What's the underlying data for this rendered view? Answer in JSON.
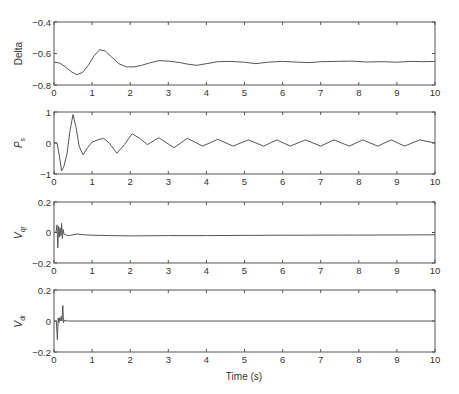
{
  "figure": {
    "xlabel": "Time (s)",
    "colors": {
      "axis": "#555555",
      "line": "#555555",
      "text": "#333333"
    }
  },
  "chart_data": [
    {
      "type": "line",
      "ylabel": "Delta",
      "ylabel_sub": "",
      "ylabel_italic": false,
      "ylim": [
        -0.8,
        -0.4
      ],
      "yticks": [
        -0.8,
        -0.6,
        -0.4
      ],
      "ytick_labels": [
        "−0.8",
        "−0.6",
        "−0.4"
      ],
      "xlim": [
        0,
        10
      ],
      "xticks": [
        0,
        1,
        2,
        3,
        4,
        5,
        6,
        7,
        8,
        9,
        10
      ],
      "grid": false,
      "x": [
        0,
        0.15,
        0.3,
        0.45,
        0.6,
        0.75,
        0.9,
        1.05,
        1.2,
        1.35,
        1.5,
        1.7,
        1.9,
        2.1,
        2.3,
        2.5,
        2.75,
        3.0,
        3.3,
        3.5,
        3.75,
        4.0,
        4.3,
        4.6,
        5.0,
        5.3,
        5.6,
        6.0,
        6.4,
        6.7,
        7.0,
        7.4,
        7.8,
        8.2,
        8.6,
        9.0,
        9.4,
        9.7,
        10
      ],
      "values": [
        -0.655,
        -0.66,
        -0.685,
        -0.715,
        -0.735,
        -0.72,
        -0.675,
        -0.615,
        -0.575,
        -0.585,
        -0.62,
        -0.665,
        -0.685,
        -0.685,
        -0.675,
        -0.66,
        -0.645,
        -0.648,
        -0.657,
        -0.667,
        -0.675,
        -0.665,
        -0.652,
        -0.65,
        -0.655,
        -0.665,
        -0.655,
        -0.65,
        -0.655,
        -0.658,
        -0.652,
        -0.65,
        -0.648,
        -0.654,
        -0.652,
        -0.655,
        -0.65,
        -0.652,
        -0.65
      ]
    },
    {
      "type": "line",
      "ylabel": "P",
      "ylabel_sub": "s",
      "ylabel_italic": true,
      "ylim": [
        -1,
        1
      ],
      "yticks": [
        -1,
        0,
        1
      ],
      "ytick_labels": [
        "−1",
        "0",
        "1"
      ],
      "xlim": [
        0,
        10
      ],
      "xticks": [
        0,
        1,
        2,
        3,
        4,
        5,
        6,
        7,
        8,
        9,
        10
      ],
      "grid": false,
      "x": [
        0,
        0.08,
        0.14,
        0.2,
        0.26,
        0.34,
        0.42,
        0.5,
        0.58,
        0.66,
        0.76,
        0.88,
        1.0,
        1.15,
        1.3,
        1.45,
        1.65,
        1.85,
        2.05,
        2.25,
        2.45,
        2.75,
        3.15,
        3.5,
        3.9,
        4.3,
        4.7,
        5.1,
        5.5,
        5.85,
        6.2,
        6.6,
        7.0,
        7.35,
        7.75,
        8.1,
        8.5,
        8.85,
        9.2,
        9.6,
        10
      ],
      "values": [
        0,
        0,
        -0.4,
        -0.9,
        -0.75,
        -0.35,
        0.4,
        0.92,
        0.5,
        -0.1,
        -0.38,
        -0.15,
        0.03,
        0.1,
        0.15,
        0.0,
        -0.33,
        -0.05,
        0.3,
        0.15,
        -0.05,
        0.17,
        -0.15,
        0.15,
        -0.1,
        0.12,
        -0.1,
        0.1,
        -0.1,
        0.1,
        -0.1,
        0.1,
        -0.1,
        0.1,
        -0.1,
        0.1,
        -0.1,
        0.1,
        -0.1,
        0.1,
        0.0
      ]
    },
    {
      "type": "line",
      "ylabel": "V",
      "ylabel_sub": "qr",
      "ylabel_italic": true,
      "ylim": [
        -0.2,
        0.2
      ],
      "yticks": [
        -0.2,
        0,
        0.2
      ],
      "ytick_labels": [
        "−0.2",
        "0",
        "0.2"
      ],
      "xlim": [
        0,
        10
      ],
      "xticks": [
        0,
        1,
        2,
        3,
        4,
        5,
        6,
        7,
        8,
        9,
        10
      ],
      "grid": false,
      "x": [
        0,
        0.05,
        0.08,
        0.1,
        0.12,
        0.14,
        0.16,
        0.18,
        0.2,
        0.22,
        0.24,
        0.26,
        0.3,
        0.4,
        0.6,
        0.8,
        1.0,
        1.5,
        2.0,
        3.0,
        4.0,
        6.0,
        8.0,
        10
      ],
      "values": [
        0,
        0,
        0.05,
        -0.1,
        0.04,
        -0.03,
        0.03,
        -0.02,
        0.06,
        -0.04,
        0.02,
        -0.01,
        -0.015,
        -0.02,
        -0.01,
        -0.015,
        -0.018,
        -0.02,
        -0.022,
        -0.02,
        -0.02,
        -0.018,
        -0.017,
        -0.015
      ]
    },
    {
      "type": "line",
      "ylabel": "V",
      "ylabel_sub": "dr",
      "ylabel_italic": true,
      "ylim": [
        -0.2,
        0.2
      ],
      "yticks": [
        -0.2,
        0,
        0.2
      ],
      "ytick_labels": [
        "−0.2",
        "0",
        "0.2"
      ],
      "xlim": [
        0,
        10
      ],
      "xticks": [
        0,
        1,
        2,
        3,
        4,
        5,
        6,
        7,
        8,
        9,
        10
      ],
      "grid": false,
      "x": [
        0,
        0.06,
        0.09,
        0.11,
        0.13,
        0.15,
        0.17,
        0.19,
        0.21,
        0.23,
        0.25,
        0.28,
        0.35,
        1,
        2,
        4,
        6,
        8,
        10
      ],
      "values": [
        0,
        0,
        -0.12,
        0.02,
        -0.01,
        0.02,
        0.0,
        0.03,
        0.0,
        0.1,
        -0.01,
        0.005,
        0,
        0,
        0,
        0,
        0,
        0,
        0
      ]
    }
  ]
}
